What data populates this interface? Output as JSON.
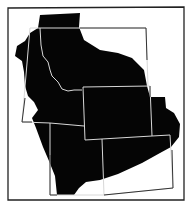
{
  "map": {
    "type": "regional-silhouette-map",
    "description": "Black silhouette region overlaid on outlined western US state boundaries",
    "colors": {
      "background": "#ffffff",
      "frame": "#222222",
      "region_fill": "#050505",
      "state_lines_on_region": "#d8d8d8",
      "state_lines_on_background": "#333333"
    },
    "states_outlined": [
      "Idaho",
      "Montana",
      "Wyoming",
      "Nevada-edge",
      "Utah",
      "Colorado"
    ],
    "labels": []
  }
}
